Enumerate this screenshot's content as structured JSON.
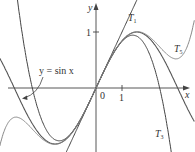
{
  "figure": {
    "axes": {
      "x_label": "x",
      "y_label": "y",
      "origin_label": "0",
      "x_tick_label": "1",
      "y_tick_label": "1",
      "x_range": [
        -3.7,
        3.8
      ],
      "y_range": [
        -1.15,
        1.55
      ]
    },
    "curves": [
      {
        "name": "sin",
        "label": "y = sin x",
        "color": "#555555"
      },
      {
        "name": "T1",
        "label": "T",
        "sub": "1",
        "color": "#444444"
      },
      {
        "name": "T3",
        "label": "T",
        "sub": "3",
        "color": "#444444"
      },
      {
        "name": "T5",
        "label": "T",
        "sub": "5",
        "color": "#888888"
      }
    ]
  }
}
